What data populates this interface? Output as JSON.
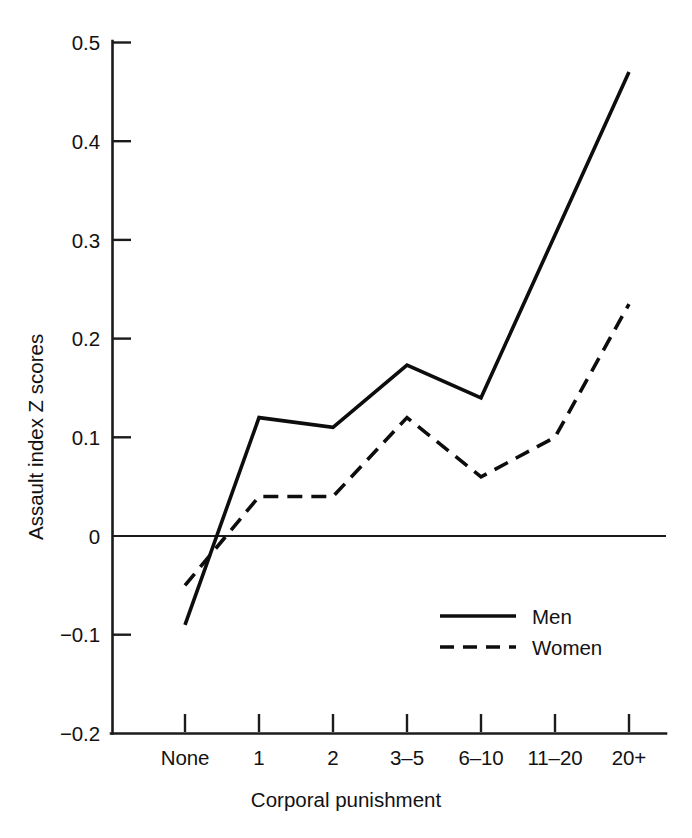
{
  "chart_data": {
    "type": "line",
    "title": "",
    "xlabel": "Corporal punishment",
    "ylabel": "Assault index Z scores",
    "categories": [
      "None",
      "1",
      "2",
      "3–5",
      "6–10",
      "11–20",
      "20+"
    ],
    "series": [
      {
        "name": "Men",
        "style": "solid",
        "values": [
          -0.09,
          0.12,
          0.11,
          0.173,
          0.14,
          0.305,
          0.47
        ]
      },
      {
        "name": "Women",
        "style": "dashed",
        "values": [
          -0.05,
          0.04,
          0.04,
          0.12,
          0.06,
          0.1,
          0.235
        ]
      }
    ],
    "ylim": [
      -0.2,
      0.5
    ],
    "yticks": [
      -0.2,
      -0.1,
      0,
      0.1,
      0.2,
      0.3,
      0.4,
      0.5
    ],
    "ytick_labels": [
      "−0.2",
      "−0.1",
      "0",
      "0.1",
      "0.2",
      "0.3",
      "0.4",
      "0.5"
    ],
    "grid": false,
    "zero_reference_line": true,
    "legend_position": "lower-right",
    "legend_entries": [
      "Men",
      "Women"
    ],
    "line_color": "#0d0d0d",
    "background_color": "#ffffff"
  },
  "axes": {
    "y_title": "Assault index Z scores",
    "x_title": "Corporal punishment"
  },
  "legend": {
    "men_label": "Men",
    "women_label": "Women"
  },
  "ytick_labels": {
    "t0": "0.5",
    "t1": "0.4",
    "t2": "0.3",
    "t3": "0.2",
    "t4": "0.1",
    "t5": "0",
    "t6": "−0.1",
    "t7": "−0.2"
  },
  "xtick_labels": {
    "t0": "None",
    "t1": "1",
    "t2": "2",
    "t3": "3–5",
    "t4": "6–10",
    "t5": "11–20",
    "t6": "20+"
  }
}
